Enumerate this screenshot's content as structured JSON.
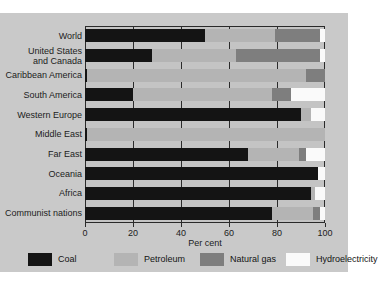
{
  "chart_data": {
    "type": "bar",
    "orientation": "horizontal",
    "stacked": true,
    "title": "",
    "xlabel": "Per cent",
    "ylabel": "",
    "xlim": [
      0,
      100
    ],
    "xticks": [
      0,
      20,
      40,
      60,
      80,
      100
    ],
    "xtick_labels": [
      "0",
      "20",
      "40",
      "60",
      "80",
      "100"
    ],
    "grid": true,
    "legend_position": "bottom",
    "categories": [
      "World",
      "United States\nand Canada",
      "Caribbean America",
      "South America",
      "Western Europe",
      "Middle East",
      "Far East",
      "Oceania",
      "Africa",
      "Communist nations"
    ],
    "series": [
      {
        "name": "Coal",
        "color": "#141414",
        "values": [
          50,
          28,
          1,
          20,
          90,
          1,
          68,
          97,
          94,
          78
        ]
      },
      {
        "name": "Petroleum",
        "color": "#b4b4b4",
        "values": [
          29,
          35,
          91,
          58,
          4,
          99,
          21,
          0,
          2,
          17
        ]
      },
      {
        "name": "Natural gas",
        "color": "#7e7e7e",
        "values": [
          19,
          35,
          8,
          8,
          0,
          0,
          3,
          0,
          0,
          3
        ]
      },
      {
        "name": "Hydroelectricity",
        "color": "#fafafa",
        "values": [
          2,
          2,
          0,
          14,
          6,
          0,
          8,
          3,
          4,
          2
        ]
      }
    ]
  },
  "legend": {
    "items": [
      {
        "label": "Coal",
        "key": "coal"
      },
      {
        "label": "Petroleum",
        "key": "petroleum"
      },
      {
        "label": "Natural gas",
        "key": "gas"
      },
      {
        "label": "Hydroelectricity",
        "key": "hydro"
      }
    ]
  },
  "axis": {
    "title": "Per cent"
  },
  "colors": {
    "coal": "#141414",
    "petroleum": "#b4b4b4",
    "gas": "#7e7e7e",
    "hydro": "#fafafa",
    "plot_background": "#c4c4c4",
    "page_background": "#c9c9c9",
    "axis": "#2b2b2b"
  }
}
